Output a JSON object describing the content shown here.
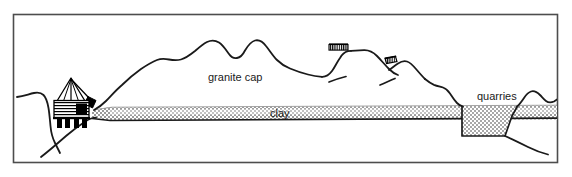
{
  "figure": {
    "frame": {
      "x": 13,
      "y": 14,
      "width": 545,
      "height": 149,
      "stroke_color": "#4d4d4d",
      "fill_color": "#ffffff"
    }
  },
  "labels": {
    "granite_cap": "granite cap",
    "clay": "clay",
    "quarries": "quarries"
  },
  "colors": {
    "outline": "#000000",
    "frame": "#4d4d4d",
    "clay_fill": "#b3b3b3",
    "clay_fill_light": "#c9c9c9",
    "quarry_pit_fill": "#c4c4c4",
    "building_dark": "#111111",
    "background": "#ffffff"
  },
  "features": [
    {
      "name": "granite-cap-ridge",
      "label": "granite cap",
      "description": "Undulating granite-capped hill forming the upper surface profile"
    },
    {
      "name": "clay-seam",
      "label": "clay",
      "description": "Horizontal stippled clay bed running across the section"
    },
    {
      "name": "quarry-pit",
      "label": "quarries",
      "description": "Excavated trapezoidal pit cut into the clay bed on the right side"
    },
    {
      "name": "quarry-works-building",
      "label": "",
      "description": "Mine head-frame and works building on the left slope"
    },
    {
      "name": "hilltop-structure-left",
      "label": "",
      "description": "Small hatched structure on the first ridge crest"
    },
    {
      "name": "hilltop-structure-right",
      "label": "",
      "description": "Small hatched structure on the second ridge crest"
    }
  ],
  "geometry": {
    "ground_profile": "M 17 99 C 26 97 32 95 38 94 C 43 93 45 96 47 101 C 49 107 50 116 51 124 C 52 133 54 141 57 147 L 62 156",
    "granite_ridge": "M 97 116 C 104 112 110 106 116 100 C 124 92 131 84 139 78 C 147 72 153 68 160 64 C 166 61 170 59 174 58 C 178 57 181 58 185 58 C 190 58 195 57 200 55 C 206 52 210 48 215 44 C 219 41 223 39 227 38 C 231 37 234 38 237 40 C 241 43 243 48 245 52 C 247 56 249 58 252 58 C 255 58 258 55 260 51 C 262 47 264 43 267 42 C 270 41 273 43 276 47 C 279 51 281 56 284 60 C 287 64 290 66 293 68 C 297 70 301 72 305 74 C 310 76 316 78 321 79",
    "ridge_tail": "M 321 79 C 327 80 331 78 336 73 C 340 69 343 63 346 58 C 349 53 352 50 356 49 L 360 48",
    "clay_top_y": 108,
    "clay_bottom_y": 121,
    "clay_left_x": 94,
    "clay_right_x": 545,
    "quarry_pit": "M 466 108 L 466 141 L 510 141 L 516 117 L 520 108 Z"
  }
}
